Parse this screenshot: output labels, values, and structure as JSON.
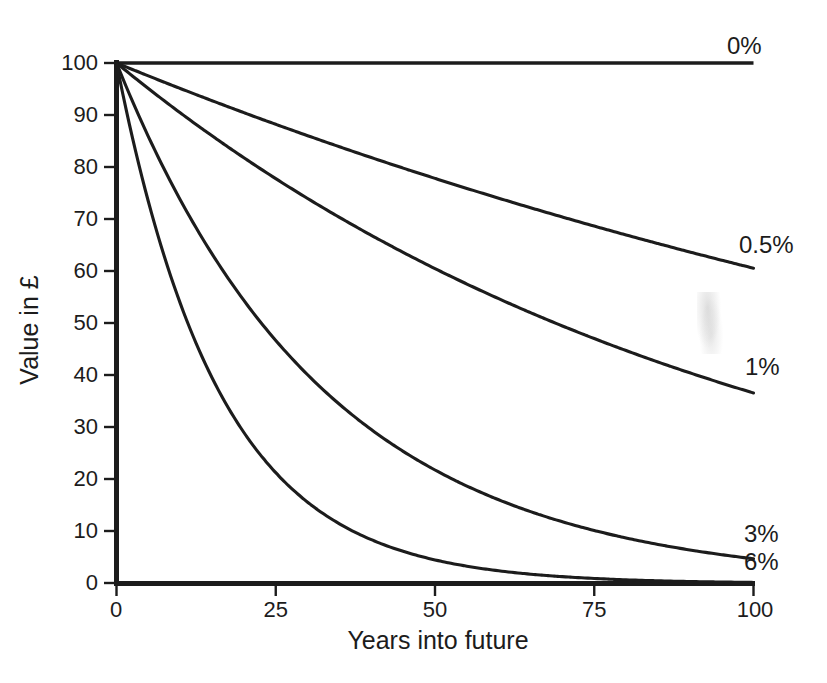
{
  "chart_data": {
    "type": "line",
    "title": "",
    "xlabel": "Years into future",
    "ylabel": "Value in £",
    "xlim": [
      0,
      100
    ],
    "ylim": [
      0,
      100
    ],
    "xticks": [
      0,
      25,
      50,
      75,
      100
    ],
    "yticks": [
      0,
      10,
      20,
      30,
      40,
      50,
      60,
      70,
      80,
      90,
      100
    ],
    "xtick_labels": [
      "0",
      "25",
      "50",
      "75",
      "100"
    ],
    "ytick_labels": [
      "0",
      "10",
      "20",
      "30",
      "40",
      "50",
      "60",
      "70",
      "80",
      "90",
      "100"
    ],
    "grid": false,
    "legend_position": "right-of-line-ends",
    "line_color": "#1c1c1c",
    "background_color": "#ffffff",
    "x": [
      0,
      5,
      10,
      15,
      20,
      25,
      30,
      35,
      40,
      45,
      50,
      55,
      60,
      65,
      70,
      75,
      80,
      85,
      90,
      95,
      100
    ],
    "series": [
      {
        "name": "0%",
        "label": "0%",
        "rate": 0.0,
        "values": [
          100,
          100,
          100,
          100,
          100,
          100,
          100,
          100,
          100,
          100,
          100,
          100,
          100,
          100,
          100,
          100,
          100,
          100,
          100,
          100,
          100
        ]
      },
      {
        "name": "0.5%",
        "label": "0.5%",
        "rate": 0.005,
        "values": [
          100,
          97.5,
          95.1,
          92.8,
          90.5,
          88.2,
          86.0,
          83.9,
          81.8,
          79.8,
          77.8,
          75.9,
          74.0,
          72.2,
          70.4,
          68.7,
          67.0,
          65.3,
          63.7,
          62.1,
          60.6
        ]
      },
      {
        "name": "1%",
        "label": "1%",
        "rate": 0.01,
        "values": [
          100,
          95.1,
          90.4,
          86.0,
          81.8,
          77.8,
          74.0,
          70.3,
          66.9,
          63.6,
          60.5,
          57.5,
          54.7,
          52.0,
          49.5,
          47.0,
          44.7,
          42.5,
          40.5,
          38.5,
          36.6
        ]
      },
      {
        "name": "3%",
        "label": "3%",
        "rate": 0.03,
        "values": [
          100,
          85.9,
          73.7,
          63.3,
          54.4,
          46.7,
          40.1,
          34.4,
          29.6,
          25.4,
          21.8,
          18.7,
          16.1,
          13.8,
          11.9,
          10.2,
          8.8,
          7.5,
          6.5,
          5.5,
          4.8
        ]
      },
      {
        "name": "6%",
        "label": "6%",
        "rate": 0.06,
        "values": [
          100,
          73.4,
          53.9,
          39.5,
          29.0,
          21.3,
          15.6,
          11.5,
          8.4,
          6.2,
          4.5,
          3.3,
          2.4,
          1.8,
          1.3,
          1.0,
          0.7,
          0.5,
          0.4,
          0.3,
          0.2
        ]
      }
    ]
  },
  "axes": {
    "y_title": "Value in £",
    "x_title": "Years into future"
  },
  "ytick_labels": {
    "t0": "0",
    "t1": "10",
    "t2": "20",
    "t3": "30",
    "t4": "40",
    "t5": "50",
    "t6": "60",
    "t7": "70",
    "t8": "80",
    "t9": "90",
    "t10": "100"
  },
  "xtick_labels": {
    "t0": "0",
    "t1": "25",
    "t2": "50",
    "t3": "75",
    "t4": "100"
  },
  "series_labels": {
    "s0": "0%",
    "s1": "0.5%",
    "s2": "1%",
    "s3": "3%",
    "s4": "6%"
  }
}
